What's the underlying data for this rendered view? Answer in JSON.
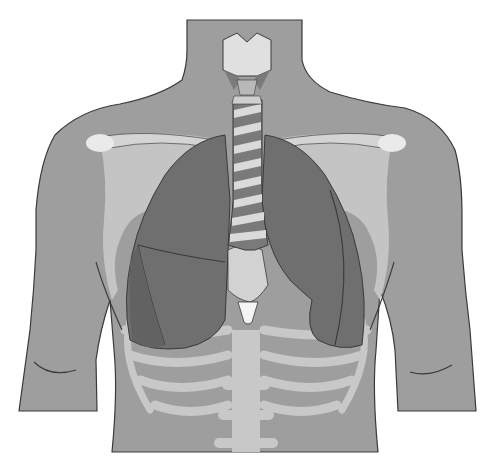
{
  "figure": {
    "labels": [],
    "colors": {
      "background": "#ffffff",
      "skin": "#9e9e9e",
      "skin_outline": "#3a3a3a",
      "bone": "#c9c9c9",
      "bone_highlight": "#ececec",
      "lung": "#6f6f6f",
      "lung_lower": "#626262",
      "trachea_ring": "#d9d9d9",
      "trachea_dark": "#7a7a7a",
      "larynx": "#e0e0e0",
      "mediastinum": "#d2d2d2"
    }
  }
}
